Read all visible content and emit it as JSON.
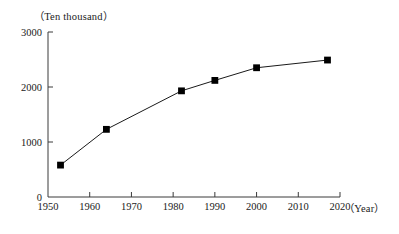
{
  "chart_data": {
    "type": "line",
    "title": "",
    "xlabel": "（Year）",
    "ylabel": "（Ten thousand）",
    "x": [
      1953,
      1964,
      1982,
      1990,
      2000,
      2017
    ],
    "values": [
      580,
      1230,
      1930,
      2120,
      2350,
      2490
    ],
    "series": [
      {
        "name": "",
        "x": [
          1953,
          1964,
          1982,
          1990,
          2000,
          2017
        ],
        "values": [
          580,
          1230,
          1930,
          2120,
          2350,
          2490
        ]
      }
    ],
    "xlim": [
      1950,
      2020
    ],
    "ylim": [
      0,
      3000
    ],
    "xticks": [
      1950,
      1960,
      1970,
      1980,
      1990,
      2000,
      2010,
      2020
    ],
    "yticks": [
      0,
      1000,
      2000,
      3000
    ],
    "xtick_labels": [
      "1950",
      "1960",
      "1970",
      "1980",
      "1990",
      "2000",
      "2010",
      "2020"
    ],
    "ytick_labels": [
      "0",
      "1000",
      "2000",
      "3000"
    ],
    "grid": false,
    "legend": null,
    "marker": "filled-square",
    "line_color": "#1a1a1a",
    "marker_color": "#000000",
    "axis_color": "#3a3a3a"
  },
  "axes": {
    "y_unit_label": "（Ten thousand）",
    "x_unit_label": "（Year）"
  }
}
